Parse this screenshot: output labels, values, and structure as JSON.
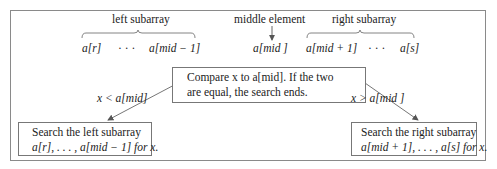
{
  "diagram": {
    "top_labels": {
      "left_subarray": "left subarray",
      "middle_element": "middle element",
      "right_subarray": "right subarray"
    },
    "array_elements": {
      "left_first": "a[r]",
      "left_dots": "· · ·",
      "left_last": "a[mid − 1]",
      "middle": "a[mid ]",
      "right_first": "a[mid + 1]",
      "right_dots": "· · ·",
      "right_last": "a[s]"
    },
    "compare_box": {
      "line1": "Compare x to a[mid].  If the two",
      "line2": "are equal, the search ends."
    },
    "edges": {
      "left_condition": "x < a[mid]",
      "right_condition": "x > a[mid ]"
    },
    "left_box": {
      "line1": "Search the left subarray",
      "line2": "a[r], . . . , a[mid − 1] for x."
    },
    "right_box": {
      "line1": "Search the right subarray",
      "line2": "a[mid + 1], . . . , a[s] for x."
    },
    "colors": {
      "line": "#666666",
      "text": "#222222",
      "frame": "#8a8a8a"
    }
  }
}
